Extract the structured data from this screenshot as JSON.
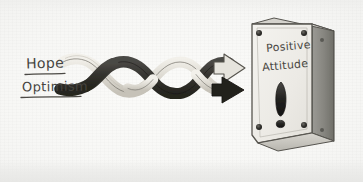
{
  "image": {
    "medium": "pencil sketch on paper",
    "background_color": "#f7f7f5",
    "ink_color": "#46443f"
  },
  "inputs": {
    "label_top": "Hope",
    "label_bottom": "Optimism"
  },
  "flow": {
    "ribbon_dark_name": "dark-ribbon",
    "ribbon_light_name": "light-ribbon",
    "dark_color": "#3a3a38",
    "light_color": "#e4e2dc",
    "outline_color": "#5a5852",
    "twist_count": 3
  },
  "arrows": {
    "upper_style": "hollow-outline",
    "lower_style": "solid-filled",
    "direction": "right"
  },
  "plaque": {
    "line1": "Positive",
    "line2": "Attitude",
    "punctuation": "!",
    "front_color": "#f0efeb",
    "side_color": "#8a8a86",
    "edge_color": "#55534e",
    "screw_color": "#2f2e2c",
    "screw_count": 4
  }
}
